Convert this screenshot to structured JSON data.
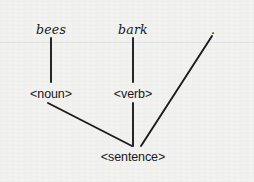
{
  "diagram": {
    "background_color": "#f2f2f1",
    "ink_color": "#1b1b1b",
    "nodes": [
      {
        "id": "bees",
        "label": "bees",
        "kind": "terminal",
        "x": 51,
        "y": 30
      },
      {
        "id": "bark",
        "label": "bark",
        "kind": "terminal",
        "x": 133,
        "y": 30
      },
      {
        "id": "period",
        "label": ".",
        "kind": "terminal",
        "x": 213,
        "y": 30
      },
      {
        "id": "noun",
        "label": "<noun>",
        "kind": "nonterminal",
        "x": 51,
        "y": 95
      },
      {
        "id": "verb",
        "label": "<verb>",
        "kind": "nonterminal",
        "x": 133,
        "y": 95
      },
      {
        "id": "sentence",
        "label": "<sentence>",
        "kind": "nonterminal",
        "x": 133,
        "y": 158
      }
    ],
    "edges": [
      {
        "id": "bees-noun",
        "from": "bees",
        "to": "noun",
        "x1": 51,
        "y1": 38,
        "x2": 51,
        "y2": 82
      },
      {
        "id": "bark-verb",
        "from": "bark",
        "to": "verb",
        "x1": 133,
        "y1": 38,
        "x2": 133,
        "y2": 82
      },
      {
        "id": "noun-sentence",
        "from": "noun",
        "to": "sentence",
        "x1": 48,
        "y1": 103,
        "x2": 132,
        "y2": 146
      },
      {
        "id": "verb-sentence",
        "from": "verb",
        "to": "sentence",
        "x1": 133,
        "y1": 103,
        "x2": 133,
        "y2": 146
      },
      {
        "id": "period-sentence",
        "from": "period",
        "to": "sentence",
        "x1": 212,
        "y1": 36,
        "x2": 141,
        "y2": 146
      }
    ],
    "artifact": {
      "scan_line_y": 42
    }
  }
}
